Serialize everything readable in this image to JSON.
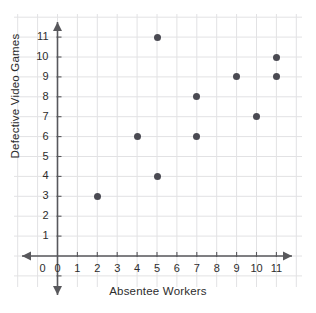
{
  "chart_data": {
    "type": "scatter",
    "title": "",
    "xlabel": "Absentee Workers",
    "ylabel": "Defective Video Games",
    "xticks": [
      "0",
      "1",
      "2",
      "3",
      "4",
      "5",
      "6",
      "7",
      "8",
      "9",
      "10",
      "11"
    ],
    "yticks": [
      "1",
      "2",
      "3",
      "4",
      "5",
      "6",
      "7",
      "8",
      "9",
      "10",
      "11"
    ],
    "xlim": [
      0,
      11
    ],
    "ylim": [
      0,
      11
    ],
    "grid": true,
    "legend": "none",
    "point_color": "#4a4a52",
    "grid_color": "#e2e2e4",
    "axis_color": "#58585c",
    "points": [
      {
        "x": 2,
        "y": 3
      },
      {
        "x": 4,
        "y": 6
      },
      {
        "x": 5,
        "y": 11
      },
      {
        "x": 5,
        "y": 4
      },
      {
        "x": 7,
        "y": 8
      },
      {
        "x": 7,
        "y": 6
      },
      {
        "x": 9,
        "y": 9
      },
      {
        "x": 10,
        "y": 7
      },
      {
        "x": 11,
        "y": 10
      },
      {
        "x": 11,
        "y": 9
      }
    ]
  }
}
